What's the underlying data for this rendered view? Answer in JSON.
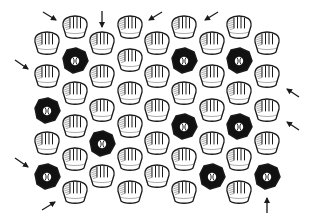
{
  "diagram": {
    "description": "Hexagonal staggered grid of baseball gloves with some baseballs (black cells); arrows around the border point inward",
    "colors": {
      "ink": "#1a1a1a",
      "paper": "#ffffff",
      "ball_fill": "#111111",
      "ball_symbol": "#ffffff"
    },
    "cell_icon_glove": "baseball-glove-icon",
    "cell_icon_ball": "baseball-icon",
    "grid": {
      "columns": [
        {
          "x": 47,
          "rows": [
            {
              "y": 44,
              "type": "glove"
            },
            {
              "y": 77,
              "type": "glove"
            },
            {
              "y": 111,
              "type": "ball"
            },
            {
              "y": 144,
              "type": "glove"
            },
            {
              "y": 177,
              "type": "ball"
            }
          ]
        },
        {
          "x": 75,
          "rows": [
            {
              "y": 28,
              "type": "glove"
            },
            {
              "y": 61,
              "type": "ball"
            },
            {
              "y": 94,
              "type": "glove"
            },
            {
              "y": 127,
              "type": "glove"
            },
            {
              "y": 160,
              "type": "glove"
            },
            {
              "y": 193,
              "type": "glove"
            }
          ]
        },
        {
          "x": 102,
          "rows": [
            {
              "y": 44,
              "type": "glove"
            },
            {
              "y": 77,
              "type": "glove"
            },
            {
              "y": 111,
              "type": "glove"
            },
            {
              "y": 144,
              "type": "ball"
            },
            {
              "y": 177,
              "type": "glove"
            }
          ]
        },
        {
          "x": 130,
          "rows": [
            {
              "y": 28,
              "type": "glove"
            },
            {
              "y": 61,
              "type": "glove"
            },
            {
              "y": 94,
              "type": "glove"
            },
            {
              "y": 127,
              "type": "glove"
            },
            {
              "y": 160,
              "type": "glove"
            },
            {
              "y": 193,
              "type": "glove"
            }
          ]
        },
        {
          "x": 157,
          "rows": [
            {
              "y": 44,
              "type": "glove"
            },
            {
              "y": 77,
              "type": "glove"
            },
            {
              "y": 111,
              "type": "glove"
            },
            {
              "y": 144,
              "type": "glove"
            },
            {
              "y": 177,
              "type": "glove"
            }
          ]
        },
        {
          "x": 184,
          "rows": [
            {
              "y": 28,
              "type": "glove"
            },
            {
              "y": 61,
              "type": "ball"
            },
            {
              "y": 94,
              "type": "glove"
            },
            {
              "y": 127,
              "type": "ball"
            },
            {
              "y": 160,
              "type": "glove"
            },
            {
              "y": 193,
              "type": "glove"
            }
          ]
        },
        {
          "x": 212,
          "rows": [
            {
              "y": 44,
              "type": "glove"
            },
            {
              "y": 77,
              "type": "glove"
            },
            {
              "y": 111,
              "type": "glove"
            },
            {
              "y": 144,
              "type": "glove"
            },
            {
              "y": 177,
              "type": "ball"
            }
          ]
        },
        {
          "x": 239,
          "rows": [
            {
              "y": 28,
              "type": "glove"
            },
            {
              "y": 61,
              "type": "ball"
            },
            {
              "y": 94,
              "type": "glove"
            },
            {
              "y": 127,
              "type": "ball"
            },
            {
              "y": 160,
              "type": "glove"
            },
            {
              "y": 193,
              "type": "glove"
            }
          ]
        },
        {
          "x": 267,
          "rows": [
            {
              "y": 44,
              "type": "glove"
            },
            {
              "y": 77,
              "type": "glove"
            },
            {
              "y": 111,
              "type": "glove"
            },
            {
              "y": 144,
              "type": "glove"
            },
            {
              "y": 177,
              "type": "ball"
            }
          ]
        }
      ],
      "counts": {
        "gloves": 40,
        "balls": 10,
        "total": 50
      }
    },
    "arrows": [
      {
        "id": "arrow-top-1",
        "x1": 43,
        "y1": 12,
        "x2": 56,
        "y2": 20,
        "direction": "down-right"
      },
      {
        "id": "arrow-top-2",
        "x1": 102,
        "y1": 11,
        "x2": 102,
        "y2": 27,
        "direction": "down"
      },
      {
        "id": "arrow-top-3",
        "x1": 162,
        "y1": 12,
        "x2": 149,
        "y2": 20,
        "direction": "down-left"
      },
      {
        "id": "arrow-top-4",
        "x1": 218,
        "y1": 12,
        "x2": 205,
        "y2": 20,
        "direction": "down-left"
      },
      {
        "id": "arrow-left-1",
        "x1": 15,
        "y1": 60,
        "x2": 28,
        "y2": 69,
        "direction": "down-right"
      },
      {
        "id": "arrow-left-2",
        "x1": 15,
        "y1": 158,
        "x2": 28,
        "y2": 167,
        "direction": "down-right"
      },
      {
        "id": "arrow-bottom-1",
        "x1": 42,
        "y1": 210,
        "x2": 55,
        "y2": 202,
        "direction": "up-right"
      },
      {
        "id": "arrow-bottom-2",
        "x1": 267,
        "y1": 213,
        "x2": 267,
        "y2": 198,
        "direction": "up"
      },
      {
        "id": "arrow-right-1",
        "x1": 299,
        "y1": 97,
        "x2": 287,
        "y2": 89,
        "direction": "up-left"
      },
      {
        "id": "arrow-right-2",
        "x1": 299,
        "y1": 130,
        "x2": 287,
        "y2": 122,
        "direction": "up-left"
      }
    ]
  }
}
